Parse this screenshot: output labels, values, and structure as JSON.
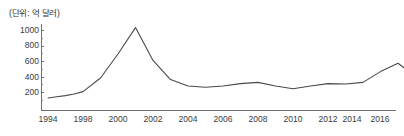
{
  "chart_data": {
    "type": "line",
    "title": "",
    "unit_note": "(단위: 억 달러)",
    "xlabel": "",
    "ylabel": "",
    "ylim": [
      0,
      1100
    ],
    "y_ticks": [
      200,
      400,
      600,
      800,
      1000
    ],
    "y_minor_ticks": [
      100,
      300,
      500,
      700,
      900,
      1100
    ],
    "grid": false,
    "legend": "none",
    "x_tick_labels": [
      "1994",
      "1998",
      "2000",
      "2002",
      "2004",
      "2006",
      "2008",
      "2010",
      "2012",
      "2014",
      "2016"
    ],
    "x": [
      1994,
      1995,
      1996,
      1997,
      1998,
      1999,
      2000,
      2001,
      2002,
      2003,
      2004,
      2005,
      2006,
      2007,
      2008,
      2009,
      2010,
      2011,
      2012,
      2013,
      2014,
      2015,
      2016,
      2017
    ],
    "values": [
      150,
      165,
      180,
      200,
      230,
      400,
      700,
      1030,
      620,
      380,
      300,
      285,
      300,
      330,
      345,
      300,
      265,
      300,
      330,
      325,
      345,
      480,
      585,
      420
    ],
    "series": [
      {
        "name": "수출액",
        "color": "#4a4a4a",
        "values": [
          150,
          165,
          180,
          200,
          230,
          400,
          700,
          1030,
          620,
          380,
          300,
          285,
          300,
          330,
          345,
          300,
          265,
          300,
          330,
          325,
          345,
          480,
          585,
          420
        ]
      }
    ],
    "annotations": [],
    "axis_color": "#6e6e6e",
    "line_color": "#4a4a4a",
    "background": "#ffffff"
  },
  "axis": {
    "y_tick_0": "1000",
    "y_tick_1": "800",
    "y_tick_2": "600",
    "y_tick_3": "400",
    "y_tick_4": "200",
    "x_tick_0": "1994",
    "x_tick_1": "1998",
    "x_tick_2": "2000",
    "x_tick_3": "2002",
    "x_tick_4": "2004",
    "x_tick_5": "2006",
    "x_tick_6": "2008",
    "x_tick_7": "2010",
    "x_tick_8": "2012",
    "x_tick_9": "2014",
    "x_tick_10": "2016"
  },
  "unit": {
    "label": "(단위: 억 달러)"
  }
}
